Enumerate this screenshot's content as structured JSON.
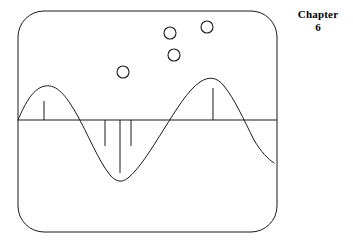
{
  "figure": {
    "caption": {
      "word": "Chapter",
      "number": "6"
    },
    "colors": {
      "stroke": "#1a1a1a",
      "background": "#ffffff",
      "text": "#000000"
    },
    "frame": {
      "shape": "rounded-rectangle",
      "x": 18,
      "y": 11,
      "width": 259,
      "height": 221,
      "corner_radius": 26,
      "stroke_width": 1
    },
    "axis": {
      "orientation": "horizontal",
      "y": 120,
      "x_start": 18,
      "x_end": 277,
      "stroke_width": 1
    },
    "circles": [
      {
        "label": "circle-1",
        "cx": 170,
        "cy": 33,
        "r": 6
      },
      {
        "label": "circle-2",
        "cx": 207,
        "cy": 27,
        "r": 6
      },
      {
        "label": "circle-3",
        "cx": 174,
        "cy": 55,
        "r": 6
      },
      {
        "label": "circle-4",
        "cx": 123,
        "cy": 72,
        "r": 6
      }
    ],
    "stems": [
      {
        "label": "stem-1",
        "x": 44,
        "y_top": 101,
        "y_bottom": 120,
        "direction": "up",
        "length": 19
      },
      {
        "label": "stem-2",
        "x": 105,
        "y_top": 120,
        "y_bottom": 146,
        "direction": "down",
        "length": 26
      },
      {
        "label": "stem-3",
        "x": 120,
        "y_top": 120,
        "y_bottom": 173,
        "direction": "down",
        "length": 53
      },
      {
        "label": "stem-4",
        "x": 131,
        "y_top": 120,
        "y_bottom": 146,
        "direction": "down",
        "length": 26
      },
      {
        "label": "stem-5",
        "x": 213,
        "y_top": 88,
        "y_bottom": 120,
        "direction": "up",
        "length": 32
      }
    ],
    "waveform": {
      "type": "sine-like-curve",
      "path": "M 18,120 C 26,101 34,88 45,86 C 57,84 66,96 76,113 C 88,134 98,160 110,175 C 116,182 122,183 128,178 C 140,168 152,148 164,129 C 176,110 188,90 200,82 C 209,76 217,77 224,86 C 234,98 244,120 254,140 C 261,152 268,159 274,163",
      "crest_left": {
        "x": 45,
        "y": 86
      },
      "trough": {
        "x": 118,
        "y": 182
      },
      "crest_right": {
        "x": 218,
        "y": 78
      },
      "end_point": {
        "x": 274,
        "y": 163
      },
      "stroke_width": 1
    }
  }
}
